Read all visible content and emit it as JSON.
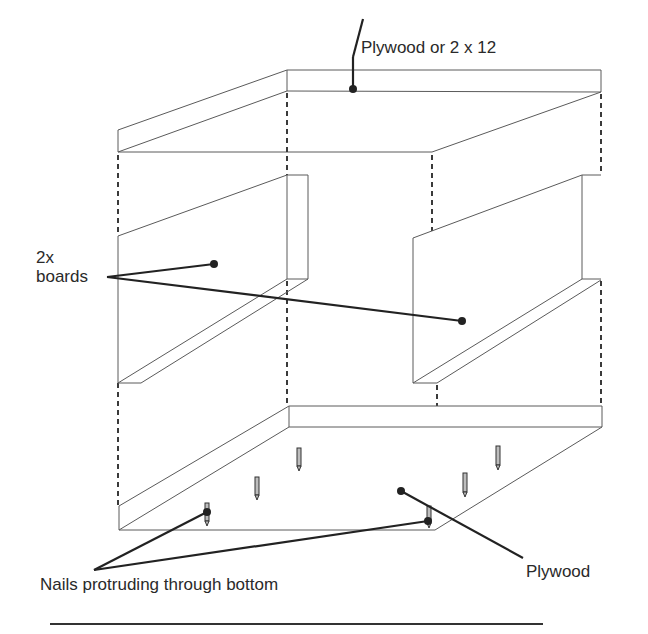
{
  "diagram": {
    "labels": {
      "top_panel": "Plywood or 2 x 12",
      "side_boards_line1": "2x",
      "side_boards_line2": "boards",
      "bottom_panel": "Plywood",
      "nails": "Nails protruding through bottom"
    },
    "parts": [
      {
        "name": "top-panel",
        "material": "Plywood or 2 x 12"
      },
      {
        "name": "left-side-board",
        "material": "2x boards"
      },
      {
        "name": "right-side-board",
        "material": "2x boards"
      },
      {
        "name": "bottom-panel",
        "material": "Plywood"
      },
      {
        "name": "nails",
        "count": 6,
        "description": "Nails protruding through bottom"
      }
    ],
    "colors": {
      "line": "#5a5a5a",
      "leader": "#222222",
      "background": "#ffffff"
    }
  }
}
